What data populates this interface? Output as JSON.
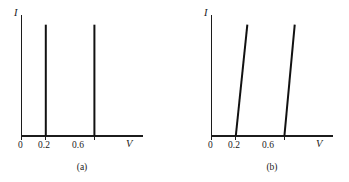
{
  "figure": {
    "background_color": "#ffffff",
    "line_color": "#111111",
    "axis_color": "#1c1c1c"
  },
  "chart_data": [
    {
      "type": "line",
      "panel_id": "a",
      "caption": "(a)",
      "title": "",
      "xlabel": "V",
      "ylabel": "I",
      "xlim": [
        0,
        1.0
      ],
      "ylim": [
        0,
        1.0
      ],
      "grid": false,
      "legend": "none",
      "tick_labels_x": [
        "0",
        "0.2",
        "0.6"
      ],
      "tick_values_x": [
        0,
        0.2,
        0.6
      ],
      "tick_labels_y": [],
      "description": "Two ideal vertical current steps at V = 0.2 V and V = 0.6 V",
      "series": [
        {
          "name": "step-at-0.2",
          "x": [
            0.2,
            0.2
          ],
          "y": [
            0.0,
            0.92
          ]
        },
        {
          "name": "step-at-0.6",
          "x": [
            0.6,
            0.6
          ],
          "y": [
            0.0,
            0.92
          ]
        }
      ]
    },
    {
      "type": "line",
      "panel_id": "b",
      "caption": "(b)",
      "title": "",
      "xlabel": "V",
      "ylabel": "I",
      "xlim": [
        0,
        1.0
      ],
      "ylim": [
        0,
        1.0
      ],
      "grid": false,
      "legend": "none",
      "tick_labels_x": [
        "0",
        "0.2",
        "0.6"
      ],
      "tick_values_x": [
        0,
        0.2,
        0.6
      ],
      "tick_labels_y": [],
      "description": "Two finite-slope current rises starting at V = 0.2 V and V = 0.6 V",
      "series": [
        {
          "name": "ramp-from-0.2",
          "x": [
            0.2,
            0.295
          ],
          "y": [
            0.0,
            0.92
          ]
        },
        {
          "name": "ramp-from-0.6",
          "x": [
            0.6,
            0.685
          ],
          "y": [
            0.0,
            0.92
          ]
        }
      ]
    }
  ],
  "panels": [
    {
      "id": "a",
      "caption": "(a)",
      "y_axis_label": "I",
      "x_axis_label": "V",
      "ticks": [
        {
          "label": "0",
          "value": 0
        },
        {
          "label": "0.2",
          "value": 0.2
        },
        {
          "label": "0.6",
          "value": 0.6
        }
      ]
    },
    {
      "id": "b",
      "caption": "(b)",
      "y_axis_label": "I",
      "x_axis_label": "V",
      "ticks": [
        {
          "label": "0",
          "value": 0
        },
        {
          "label": "0.2",
          "value": 0.2
        },
        {
          "label": "0.6",
          "value": 0.6
        }
      ]
    }
  ]
}
